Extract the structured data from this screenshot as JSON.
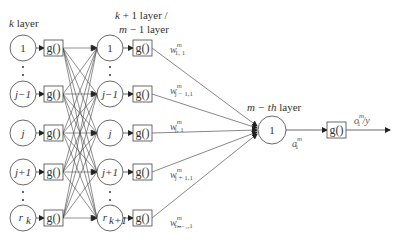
{
  "labels": {
    "k_layer": "k layer",
    "k_layer_italic": "k",
    "k_layer_rest": " layer",
    "kp1_line1_italic": "k",
    "kp1_line1_rest": " + 1 layer /",
    "kp1_line2_italic": "m",
    "kp1_line2_rest": " − 1 layer",
    "mth_italic": "m − th",
    "mth_rest": " layer"
  },
  "activation_label": "g()",
  "input_layer": {
    "nodes": [
      "1",
      "j−1",
      "j",
      "j+1",
      "r_k"
    ],
    "display": [
      {
        "main": "1",
        "sub": ""
      },
      {
        "main": "j−1",
        "sub": ""
      },
      {
        "main": "j",
        "sub": ""
      },
      {
        "main": "j+1",
        "sub": ""
      },
      {
        "main": "r",
        "sub": "k"
      }
    ]
  },
  "hidden_layer": {
    "nodes": [
      "1",
      "j−1",
      "j",
      "j+1",
      "r_k+1"
    ],
    "display": [
      {
        "main": "1",
        "sub": ""
      },
      {
        "main": "j−1",
        "sub": ""
      },
      {
        "main": "j",
        "sub": ""
      },
      {
        "main": "j+1",
        "sub": ""
      },
      {
        "main": "r",
        "sub": "k+1"
      }
    ]
  },
  "weights": [
    {
      "w": "w",
      "sup": "m",
      "sub": "1, 1"
    },
    {
      "w": "w",
      "sup": "m",
      "sub": "j − 1,1"
    },
    {
      "w": "w",
      "sup": "m",
      "sub": "j, 1"
    },
    {
      "w": "w",
      "sup": "m",
      "sub": "j + 1,1"
    },
    {
      "w": "w",
      "sup": "m",
      "sub": "rₘ₋₁,1"
    }
  ],
  "output_node": {
    "label": "1"
  },
  "output_sum": {
    "a": "a",
    "sup": "m",
    "sub": "1"
  },
  "output_final": {
    "o": "o",
    "sup": "m",
    "sub": "1",
    "rest": "/y"
  }
}
